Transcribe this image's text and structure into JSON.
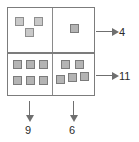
{
  "diagram": {
    "type": "2x2-array-of-squares",
    "outer_box": {
      "x": 7,
      "y": 7,
      "width": 88,
      "height": 89
    },
    "quadrants": [
      {
        "id": "top-left",
        "count": 3,
        "arrangement": "two on top, one below centered",
        "squares": [
          {
            "x": 7,
            "y": 9
          },
          {
            "x": 26,
            "y": 9
          },
          {
            "x": 17,
            "y": 20
          }
        ]
      },
      {
        "id": "top-right",
        "count": 1,
        "arrangement": "single centered square",
        "squares": [
          {
            "x": 17,
            "y": 16
          }
        ]
      },
      {
        "id": "bottom-left",
        "count": 6,
        "arrangement": "3 by 2 grid",
        "squares": [
          {
            "x": 5,
            "y": 6
          },
          {
            "x": 18,
            "y": 6
          },
          {
            "x": 31,
            "y": 6
          },
          {
            "x": 5,
            "y": 22
          },
          {
            "x": 18,
            "y": 22
          },
          {
            "x": 31,
            "y": 22
          }
        ]
      },
      {
        "id": "bottom-right",
        "count": 5,
        "arrangement": "two on top, three below offset",
        "squares": [
          {
            "x": 8,
            "y": 6
          },
          {
            "x": 22,
            "y": 6
          },
          {
            "x": 3,
            "y": 21
          },
          {
            "x": 15,
            "y": 19
          },
          {
            "x": 27,
            "y": 18
          }
        ]
      }
    ],
    "row_totals": [
      {
        "id": "top-row",
        "label": "4",
        "arrow": "arrow-right-icon"
      },
      {
        "id": "bottom-row",
        "label": "11",
        "arrow": "arrow-right-icon"
      }
    ],
    "column_totals": [
      {
        "id": "left-column",
        "label": "9",
        "arrow": "arrow-down-icon"
      },
      {
        "id": "right-column",
        "label": "6",
        "arrow": "arrow-down-icon"
      }
    ],
    "colors": {
      "box_border": "#7c7c7c",
      "divider": "#8a8a8a",
      "square_fill": "#c9c9c9",
      "square_fill_dark": "#b4b4b4",
      "square_border": "#8e8e8e",
      "arrow": "#6f6f6f",
      "label_text": "#2b2b2b",
      "background": "#ffffff"
    }
  }
}
